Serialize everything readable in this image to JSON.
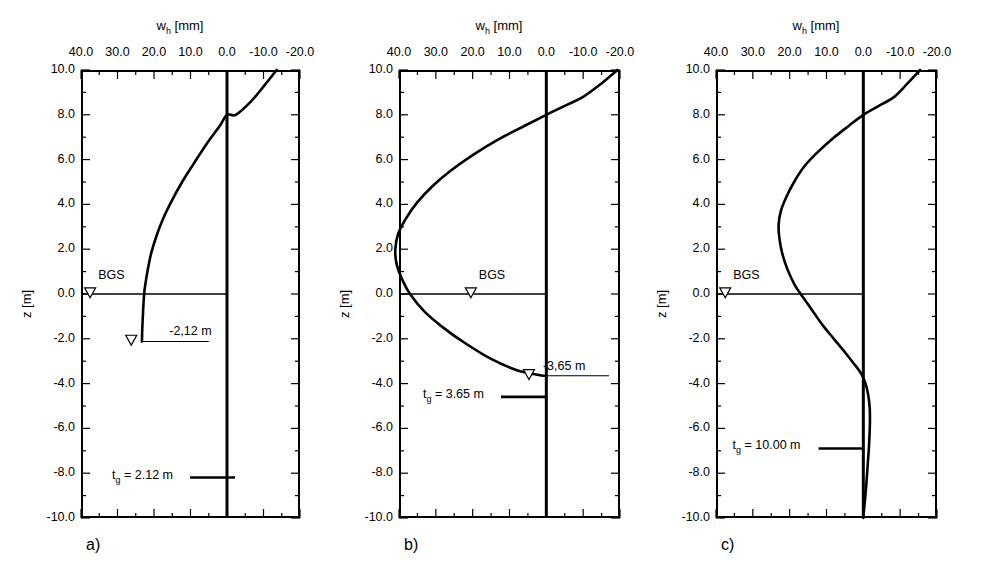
{
  "figure": {
    "panels": [
      {
        "key": "a",
        "caption": "a)",
        "axis_title": "w",
        "axis_title_sub": "h",
        "axis_title_unit": "[mm]",
        "ylabel": "z [m]",
        "bgs_label": "BGS",
        "water_table_label": "-2,12 m",
        "legend_label_main": "t",
        "legend_label_sub": "g",
        "legend_label_rest": " = 2.12 m",
        "water_table_z": -2.12
      },
      {
        "key": "b",
        "caption": "b)",
        "axis_title": "w",
        "axis_title_sub": "h",
        "axis_title_unit": "[mm]",
        "ylabel": "z [m]",
        "bgs_label": "BGS",
        "water_table_label": "-3,65 m",
        "legend_label_main": "t",
        "legend_label_sub": "g",
        "legend_label_rest": " = 3.65 m",
        "water_table_z": -3.65
      },
      {
        "key": "c",
        "caption": "c)",
        "axis_title": "w",
        "axis_title_sub": "h",
        "axis_title_unit": "[mm]",
        "ylabel": "z [m]",
        "bgs_label": "BGS",
        "water_table_label": null,
        "legend_label_main": "t",
        "legend_label_sub": "g",
        "legend_label_rest": " = 10.00 m",
        "water_table_z": null
      }
    ]
  },
  "chart_data": [
    {
      "type": "line",
      "panel": "a",
      "title": "a)",
      "xlabel": "w_h [mm]",
      "ylabel": "z [m]",
      "xlim": [
        40.0,
        -20.0
      ],
      "ylim": [
        -10.0,
        10.0
      ],
      "xticks": [
        40.0,
        30.0,
        20.0,
        10.0,
        0.0,
        -10.0,
        -20.0
      ],
      "xtick_labels": [
        "40.0",
        "30.0",
        "20.0",
        "10.0",
        "0.0",
        "-10.0",
        "-20.0"
      ],
      "xminor_step": 5.0,
      "yticks": [
        10.0,
        8.0,
        6.0,
        4.0,
        2.0,
        0.0,
        -2.0,
        -4.0,
        -6.0,
        -8.0,
        -10.0
      ],
      "ytick_labels": [
        "10.0",
        "8.0",
        "6.0",
        "4.0",
        "2.0",
        "0.0",
        "-2.0",
        "-4.0",
        "-6.0",
        "-8.0",
        "-10.0"
      ],
      "yminor_step": 1.0,
      "grid": false,
      "legend": "t_g = 2.12 m",
      "annotations": [
        "BGS",
        "-2,12 m"
      ],
      "series": [
        {
          "name": "w_h profile",
          "comment": "x = w_h [mm], y = z [m]; curve terminates at the water table depth",
          "points": [
            [
              -13.6,
              10.0
            ],
            [
              -10.2,
              9.3
            ],
            [
              -6.6,
              8.6
            ],
            [
              -2.4,
              8.0
            ],
            [
              0.0,
              8.0
            ],
            [
              2.0,
              7.5
            ],
            [
              5.6,
              6.7
            ],
            [
              9.2,
              5.8
            ],
            [
              12.3,
              5.0
            ],
            [
              15.0,
              4.2
            ],
            [
              17.4,
              3.4
            ],
            [
              19.3,
              2.6
            ],
            [
              20.8,
              1.8
            ],
            [
              21.8,
              1.0
            ],
            [
              22.4,
              0.4
            ],
            [
              22.7,
              0.0
            ],
            [
              23.0,
              -0.8
            ],
            [
              23.2,
              -1.5
            ],
            [
              23.3,
              -2.12
            ]
          ]
        },
        {
          "name": "zero reference line",
          "comment": "vertical line at w_h = 0 spanning full z range",
          "points": [
            [
              0.0,
              10.0
            ],
            [
              0.0,
              -10.0
            ]
          ]
        },
        {
          "name": "ground surface line (BGS)",
          "comment": "horizontal line at z = 0 from left frame edge to w_h = 0",
          "points": [
            [
              40.0,
              0.0
            ],
            [
              0.0,
              0.0
            ]
          ]
        },
        {
          "name": "water table line",
          "comment": "thin horizontal marker at z = -2.12",
          "points": [
            [
              23.5,
              -2.12
            ],
            [
              5.0,
              -2.12
            ]
          ]
        }
      ]
    },
    {
      "type": "line",
      "panel": "b",
      "title": "b)",
      "xlabel": "w_h [mm]",
      "ylabel": "z [m]",
      "xlim": [
        40.0,
        -20.0
      ],
      "ylim": [
        -10.0,
        10.0
      ],
      "xticks": [
        40.0,
        30.0,
        20.0,
        10.0,
        0.0,
        -10.0,
        -20.0
      ],
      "xtick_labels": [
        "40.0",
        "30.0",
        "20.0",
        "10.0",
        "0.0",
        "-10.0",
        "-20.0"
      ],
      "xminor_step": 5.0,
      "yticks": [
        10.0,
        8.0,
        6.0,
        4.0,
        2.0,
        0.0,
        -2.0,
        -4.0,
        -6.0,
        -8.0,
        -10.0
      ],
      "ytick_labels": [
        "10.0",
        "8.0",
        "6.0",
        "4.0",
        "2.0",
        "0.0",
        "-2.0",
        "-4.0",
        "-6.0",
        "-8.0",
        "-10.0"
      ],
      "yminor_step": 1.0,
      "grid": false,
      "legend": "t_g = 3.65 m",
      "annotations": [
        "BGS",
        "-3,65 m"
      ],
      "series": [
        {
          "name": "w_h profile",
          "comment": "bulged curve, maximum about 41 mm near z = 2.5",
          "points": [
            [
              -19.3,
              10.0
            ],
            [
              -15.0,
              9.4
            ],
            [
              -10.0,
              8.8
            ],
            [
              -5.0,
              8.4
            ],
            [
              0.0,
              8.0
            ],
            [
              6.0,
              7.5
            ],
            [
              13.0,
              6.9
            ],
            [
              20.0,
              6.2
            ],
            [
              26.0,
              5.5
            ],
            [
              31.0,
              4.8
            ],
            [
              35.0,
              4.1
            ],
            [
              38.0,
              3.4
            ],
            [
              40.2,
              2.7
            ],
            [
              41.0,
              2.0
            ],
            [
              40.6,
              1.3
            ],
            [
              39.0,
              0.6
            ],
            [
              37.0,
              0.0
            ],
            [
              33.0,
              -0.8
            ],
            [
              28.0,
              -1.5
            ],
            [
              22.0,
              -2.2
            ],
            [
              15.0,
              -2.9
            ],
            [
              8.0,
              -3.4
            ],
            [
              2.0,
              -3.62
            ],
            [
              0.6,
              -3.65
            ]
          ]
        },
        {
          "name": "zero reference line",
          "comment": "vertical line at w_h = 0 spanning full z range",
          "points": [
            [
              0.0,
              10.0
            ],
            [
              0.0,
              -10.0
            ]
          ]
        },
        {
          "name": "ground surface line (BGS)",
          "comment": "horizontal line at z = 0 from left frame edge to w_h = 0",
          "points": [
            [
              40.0,
              0.0
            ],
            [
              0.0,
              0.0
            ]
          ]
        },
        {
          "name": "water table line",
          "comment": "thin horizontal marker at z = -3.65 extending right past zero line",
          "points": [
            [
              2.0,
              -3.65
            ],
            [
              -17.0,
              -3.65
            ]
          ]
        }
      ]
    },
    {
      "type": "line",
      "panel": "c",
      "title": "c)",
      "xlabel": "w_h [mm]",
      "ylabel": "z [m]",
      "xlim": [
        40.0,
        -20.0
      ],
      "ylim": [
        -10.0,
        10.0
      ],
      "xticks": [
        40.0,
        30.0,
        20.0,
        10.0,
        0.0,
        -10.0,
        -20.0
      ],
      "xtick_labels": [
        "40.0",
        "30.0",
        "20.0",
        "10.0",
        "0.0",
        "-10.0",
        "-20.0"
      ],
      "xminor_step": 5.0,
      "yticks": [
        10.0,
        8.0,
        6.0,
        4.0,
        2.0,
        0.0,
        -2.0,
        -4.0,
        -6.0,
        -8.0,
        -10.0
      ],
      "ytick_labels": [
        "10.0",
        "8.0",
        "6.0",
        "4.0",
        "2.0",
        "0.0",
        "-2.0",
        "-4.0",
        "-6.0",
        "-8.0",
        "-10.0"
      ],
      "yminor_step": 1.0,
      "grid": false,
      "legend": "t_g = 10.00 m",
      "annotations": [
        "BGS"
      ],
      "series": [
        {
          "name": "w_h profile",
          "comment": "peak about 23 mm near z = 3.2; crosses zero near z = -3.3 then small negative lobe returning to 0 at z = -10",
          "points": [
            [
              -15.4,
              10.0
            ],
            [
              -12.0,
              9.4
            ],
            [
              -8.4,
              8.8
            ],
            [
              -4.2,
              8.4
            ],
            [
              0.0,
              8.0
            ],
            [
              4.0,
              7.5
            ],
            [
              8.6,
              6.9
            ],
            [
              12.6,
              6.3
            ],
            [
              16.0,
              5.7
            ],
            [
              18.8,
              5.0
            ],
            [
              21.0,
              4.3
            ],
            [
              22.4,
              3.7
            ],
            [
              23.0,
              3.1
            ],
            [
              22.8,
              2.5
            ],
            [
              22.0,
              1.8
            ],
            [
              20.6,
              1.1
            ],
            [
              18.6,
              0.4
            ],
            [
              17.0,
              0.0
            ],
            [
              14.0,
              -0.7
            ],
            [
              11.0,
              -1.4
            ],
            [
              8.0,
              -2.0
            ],
            [
              5.0,
              -2.6
            ],
            [
              2.6,
              -3.1
            ],
            [
              0.8,
              -3.5
            ],
            [
              -0.4,
              -3.9
            ],
            [
              -1.2,
              -4.4
            ],
            [
              -1.7,
              -5.0
            ],
            [
              -1.8,
              -5.6
            ],
            [
              -1.7,
              -6.2
            ],
            [
              -1.5,
              -6.9
            ],
            [
              -1.2,
              -7.6
            ],
            [
              -0.9,
              -8.3
            ],
            [
              -0.5,
              -9.1
            ],
            [
              -0.2,
              -9.6
            ],
            [
              0.0,
              -10.0
            ]
          ]
        },
        {
          "name": "zero reference line",
          "comment": "vertical line at w_h = 0 spanning full z range",
          "points": [
            [
              0.0,
              10.0
            ],
            [
              0.0,
              -10.0
            ]
          ]
        },
        {
          "name": "ground surface line (BGS)",
          "comment": "horizontal line at z = 0 from left frame edge to w_h = 0",
          "points": [
            [
              40.0,
              0.0
            ],
            [
              0.0,
              0.0
            ]
          ]
        }
      ]
    }
  ]
}
